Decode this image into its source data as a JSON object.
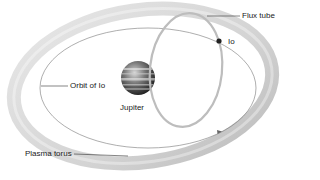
{
  "diagram": {
    "labels": {
      "flux_tube": "Flux tube",
      "io": "Io",
      "orbit_of_io": "Orbit of Io",
      "jupiter": "Jupiter",
      "plasma_torus": "Plasma torus"
    },
    "colors": {
      "torus": "#c8c8c8",
      "orbit_line": "#777777",
      "flux_tube": "#bdbdbd",
      "jupiter_dark": "#2a2a2a",
      "io": "#222222",
      "leader_line": "#333333"
    }
  }
}
